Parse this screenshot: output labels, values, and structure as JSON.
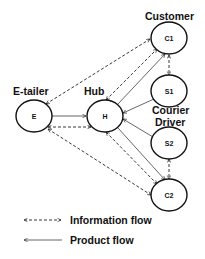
{
  "diagram": {
    "type": "flow-network",
    "labels": {
      "customer": "Customer",
      "etailer": "E-tailer",
      "hub": "Hub",
      "courier_line1": "Courier",
      "courier_line2": "Driver"
    },
    "nodes": [
      {
        "id": "C1",
        "label": "C1",
        "role": "Customer",
        "cx": 169,
        "cy": 38
      },
      {
        "id": "S1",
        "label": "S1",
        "role": "Courier Driver",
        "cx": 169,
        "cy": 91
      },
      {
        "id": "E",
        "label": "E",
        "role": "E-tailer",
        "cx": 34,
        "cy": 116
      },
      {
        "id": "H",
        "label": "H",
        "role": "Hub",
        "cx": 105,
        "cy": 116
      },
      {
        "id": "S2",
        "label": "S2",
        "role": "Courier Driver",
        "cx": 169,
        "cy": 143
      },
      {
        "id": "C2",
        "label": "C2",
        "role": "Customer",
        "cx": 169,
        "cy": 195
      }
    ],
    "edges": [
      {
        "from": "E",
        "to": "H",
        "type": "product"
      },
      {
        "from": "S1",
        "to": "H",
        "type": "product"
      },
      {
        "from": "S2",
        "to": "H",
        "type": "product"
      },
      {
        "from": "H",
        "to": "C1",
        "type": "product"
      },
      {
        "from": "H",
        "to": "C2",
        "type": "product"
      },
      {
        "from": "E",
        "to": "C1",
        "type": "information",
        "bidirectional": true
      },
      {
        "from": "E",
        "to": "H",
        "type": "information",
        "bidirectional": true
      },
      {
        "from": "E",
        "to": "C2",
        "type": "information",
        "bidirectional": true
      },
      {
        "from": "H",
        "to": "C1",
        "type": "information",
        "bidirectional": true
      },
      {
        "from": "H",
        "to": "C2",
        "type": "information",
        "bidirectional": true
      },
      {
        "from": "C1",
        "to": "S1",
        "type": "information",
        "bidirectional": true
      },
      {
        "from": "S2",
        "to": "C2",
        "type": "information",
        "bidirectional": true
      }
    ]
  },
  "legend": {
    "items": [
      {
        "symbol": "dashed-double-arrow",
        "label": "Information flow"
      },
      {
        "symbol": "solid-arrow",
        "label": "Product flow"
      }
    ]
  }
}
